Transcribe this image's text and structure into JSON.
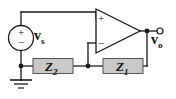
{
  "figure": {
    "background_color": "#ffffff",
    "wire_color": "#1a1a1a",
    "component_fill": "#c9c9c9",
    "component_stroke": "#555555"
  },
  "source": {
    "name": "independent voltage source",
    "label": "v",
    "label_subscript": "s",
    "plus_sign": "+",
    "minus_sign": "−",
    "shape": "circle"
  },
  "opamp": {
    "name": "operational amplifier",
    "noninverting_input_sign": "+",
    "inverting_input_sign": "−",
    "shape": "triangle"
  },
  "impedances": [
    {
      "id": "z2",
      "label": "Z",
      "label_subscript": "2",
      "position": "lower-left"
    },
    {
      "id": "z1",
      "label": "Z",
      "label_subscript": "1",
      "position": "lower-right"
    }
  ],
  "output": {
    "name": "output terminal",
    "label": "v",
    "label_subscript": "o",
    "terminal_shape": "open-circle"
  },
  "ground": {
    "name": "ground reference",
    "symbol": "earth-ground"
  },
  "nodes": [
    {
      "id": "source-bottom-node",
      "label": ""
    },
    {
      "id": "feedback-node",
      "label": ""
    },
    {
      "id": "output-node",
      "label": ""
    }
  ]
}
